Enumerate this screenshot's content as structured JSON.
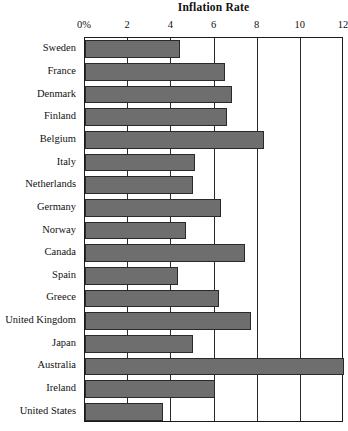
{
  "chart_data": {
    "type": "bar",
    "orientation": "horizontal",
    "title": "Inflation Rate",
    "xlabel": "",
    "ylabel": "",
    "xlim": [
      0,
      12
    ],
    "grid": true,
    "legend": "none",
    "bar_color": "#6e6e6e",
    "bar_border_color": "#2a2a2a",
    "tick_labels": [
      "0%",
      "2",
      "4",
      "6",
      "8",
      "10",
      "12"
    ],
    "tick_values": [
      0,
      2,
      4,
      6,
      8,
      10,
      12
    ],
    "categories": [
      "Sweden",
      "France",
      "Denmark",
      "Finland",
      "Belgium",
      "Italy",
      "Netherlands",
      "Germany",
      "Norway",
      "Canada",
      "Spain",
      "Greece",
      "United Kingdom",
      "Japan",
      "Australia",
      "Ireland",
      "United States"
    ],
    "values": [
      4.4,
      6.5,
      6.8,
      6.6,
      8.3,
      5.1,
      5.0,
      6.3,
      4.7,
      7.4,
      4.3,
      6.2,
      7.7,
      5.0,
      12.0,
      6.0,
      3.6
    ]
  }
}
